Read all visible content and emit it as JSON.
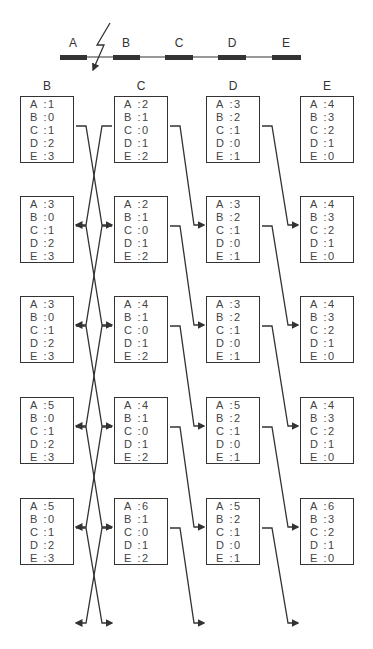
{
  "topology": {
    "nodes": [
      "A",
      "B",
      "C",
      "D",
      "E"
    ],
    "failure_between": [
      "A",
      "B"
    ],
    "failure_icon": "lightning-bolt-icon"
  },
  "columns": [
    "B",
    "C",
    "D",
    "E"
  ],
  "row_keys": [
    "A",
    "B",
    "C",
    "D",
    "E"
  ],
  "separator": ":",
  "tables": [
    [
      {
        "A": "1",
        "B": "0",
        "C": "1",
        "D": "2",
        "E": "3"
      },
      {
        "A": "2",
        "B": "1",
        "C": "0",
        "D": "1",
        "E": "2"
      },
      {
        "A": "3",
        "B": "2",
        "C": "1",
        "D": "0",
        "E": "1"
      },
      {
        "A": "4",
        "B": "3",
        "C": "2",
        "D": "1",
        "E": "0"
      }
    ],
    [
      {
        "A": "3",
        "B": "0",
        "C": "1",
        "D": "2",
        "E": "3"
      },
      {
        "A": "2",
        "B": "1",
        "C": "0",
        "D": "1",
        "E": "2"
      },
      {
        "A": "3",
        "B": "2",
        "C": "1",
        "D": "0",
        "E": "1"
      },
      {
        "A": "4",
        "B": "3",
        "C": "2",
        "D": "1",
        "E": "0"
      }
    ],
    [
      {
        "A": "3",
        "B": "0",
        "C": "1",
        "D": "2",
        "E": "3"
      },
      {
        "A": "4",
        "B": "1",
        "C": "0",
        "D": "1",
        "E": "2"
      },
      {
        "A": "3",
        "B": "2",
        "C": "1",
        "D": "0",
        "E": "1"
      },
      {
        "A": "4",
        "B": "3",
        "C": "2",
        "D": "1",
        "E": "0"
      }
    ],
    [
      {
        "A": "5",
        "B": "0",
        "C": "1",
        "D": "2",
        "E": "3"
      },
      {
        "A": "4",
        "B": "1",
        "C": "0",
        "D": "1",
        "E": "2"
      },
      {
        "A": "5",
        "B": "2",
        "C": "1",
        "D": "0",
        "E": "1"
      },
      {
        "A": "4",
        "B": "3",
        "C": "2",
        "D": "1",
        "E": "0"
      }
    ],
    [
      {
        "A": "5",
        "B": "0",
        "C": "1",
        "D": "2",
        "E": "3"
      },
      {
        "A": "6",
        "B": "1",
        "C": "0",
        "D": "1",
        "E": "2"
      },
      {
        "A": "5",
        "B": "2",
        "C": "1",
        "D": "0",
        "E": "1"
      },
      {
        "A": "6",
        "B": "3",
        "C": "2",
        "D": "1",
        "E": "0"
      }
    ]
  ],
  "colors": {
    "line": "#333333",
    "text": "#444444",
    "background": "#ffffff"
  }
}
